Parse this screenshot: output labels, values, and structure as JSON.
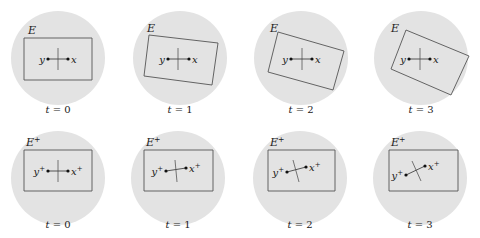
{
  "colors": {
    "disk_fill": "#e3e3e3",
    "stroke": "#444444",
    "rect_stroke": "#555555",
    "dot": "#111111",
    "tick": "#555555"
  },
  "rows": [
    {
      "region_label": "E",
      "region_sup": "",
      "point_y": "y",
      "point_x": "x",
      "sup": "",
      "panels": [
        {
          "t_label": "t = 0",
          "cx": 58,
          "cy": 58,
          "rect": "24,38 92,38 92,80 24,80",
          "y_dot": [
            48,
            59
          ],
          "x_dot": [
            68,
            59
          ],
          "tick": [
            58,
            48,
            58,
            70
          ],
          "E_pos": [
            28,
            34
          ],
          "label_y": 113
        },
        {
          "t_label": "t = 1",
          "cx": 180,
          "cy": 58,
          "rect": "149,35 218,43 212,85 144,76",
          "y_dot": [
            168,
            59
          ],
          "x_dot": [
            189,
            59
          ],
          "tick": [
            178,
            48,
            178,
            70
          ],
          "E_pos": [
            147,
            32
          ],
          "label_y": 113
        },
        {
          "t_label": "t = 2",
          "cx": 301,
          "cy": 58,
          "rect": "278,32 344,51 333,90 268,72",
          "y_dot": [
            291,
            59
          ],
          "x_dot": [
            312,
            59
          ],
          "tick": [
            302,
            48,
            302,
            70
          ],
          "E_pos": [
            270,
            32
          ],
          "label_y": 113
        },
        {
          "t_label": "t = 3",
          "cx": 421,
          "cy": 58,
          "rect": "406,30 469,56 451,95 391,69",
          "y_dot": [
            409,
            59
          ],
          "x_dot": [
            430,
            59
          ],
          "tick": [
            420,
            48,
            420,
            70
          ],
          "E_pos": [
            391,
            32
          ],
          "label_y": 113
        }
      ]
    },
    {
      "region_label": "E",
      "region_sup": "+",
      "point_y": "y",
      "point_x": "x",
      "sup": "+",
      "panels": [
        {
          "t_label": "t = 0",
          "cx": 58,
          "cy": 178,
          "rect": "24,150 92,150 92,191 24,191",
          "y_dot": [
            48,
            171
          ],
          "x_dot": [
            68,
            171
          ],
          "tick": [
            58,
            160,
            58,
            182
          ],
          "E_pos": [
            26,
            146
          ],
          "label_y": 228
        },
        {
          "t_label": "t = 1",
          "cx": 178,
          "cy": 178,
          "rect": "144,150 213,150 213,191 144,191",
          "y_dot": [
            166,
            171
          ],
          "x_dot": [
            186,
            168
          ],
          "tick": [
            175,
            160,
            177,
            182
          ],
          "E_pos": [
            146,
            146
          ],
          "label_y": 228
        },
        {
          "t_label": "t = 2",
          "cx": 300,
          "cy": 178,
          "rect": "268,150 335,150 335,191 268,191",
          "y_dot": [
            287,
            172
          ],
          "x_dot": [
            306,
            167
          ],
          "tick": [
            293,
            160,
            299,
            182
          ],
          "E_pos": [
            270,
            146
          ],
          "label_y": 228
        },
        {
          "t_label": "t = 3",
          "cx": 420,
          "cy": 178,
          "rect": "389,150 458,150 458,191 389,191",
          "y_dot": [
            406,
            175
          ],
          "x_dot": [
            425,
            166
          ],
          "tick": [
            412,
            161,
            421,
            181
          ],
          "E_pos": [
            391,
            146
          ],
          "label_y": 228
        }
      ]
    }
  ]
}
